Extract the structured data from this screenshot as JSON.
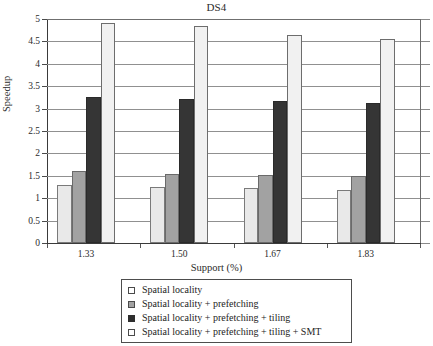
{
  "chart_data": {
    "type": "bar",
    "title": "DS4",
    "xlabel": "Support (%)",
    "ylabel": "Speedup",
    "categories": [
      "1.33",
      "1.50",
      "1.67",
      "1.83"
    ],
    "ylim": [
      0,
      5
    ],
    "ytick_labels": [
      "0",
      "0.5",
      "1",
      "1.5",
      "2",
      "2.5",
      "3",
      "3.5",
      "4",
      "4.5",
      "5"
    ],
    "ytick_values": [
      0,
      0.5,
      1,
      1.5,
      2,
      2.5,
      3,
      3.5,
      4,
      4.5,
      5
    ],
    "grid": true,
    "legend_position": "bottom",
    "series": [
      {
        "name": "Spatial locality",
        "color": "#e9e9e9",
        "values": [
          1.3,
          1.26,
          1.22,
          1.19
        ]
      },
      {
        "name": "Spatial locality + prefetching",
        "color": "#a2a2a2",
        "values": [
          1.6,
          1.55,
          1.52,
          1.5
        ]
      },
      {
        "name": "Spatial locality + prefetching + tiling",
        "color": "#353535",
        "values": [
          3.25,
          3.22,
          3.18,
          3.12
        ]
      },
      {
        "name": "Spatial locality + prefetching + tiling + SMT",
        "color": "#f1f1f1",
        "values": [
          4.92,
          4.85,
          4.65,
          4.55
        ]
      }
    ]
  }
}
